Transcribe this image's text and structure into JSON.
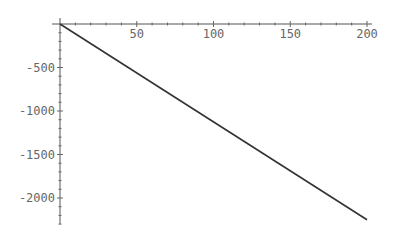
{
  "chart_data": {
    "type": "line",
    "title": "",
    "xlabel": "",
    "ylabel": "",
    "xlim": [
      0,
      200
    ],
    "ylim": [
      -2300,
      0
    ],
    "grid": false,
    "legend": null,
    "x_ticks": [
      50,
      100,
      150,
      200
    ],
    "x_tick_labels": [
      "50",
      "100",
      "150",
      "200"
    ],
    "y_ticks": [
      -500,
      -1000,
      -1500,
      -2000
    ],
    "y_tick_labels": [
      "-500",
      "-1000",
      "-1500",
      "-2000"
    ],
    "series": [
      {
        "name": "line",
        "x": [
          0,
          200
        ],
        "y": [
          0,
          -2250
        ],
        "color": "#333333"
      }
    ]
  }
}
